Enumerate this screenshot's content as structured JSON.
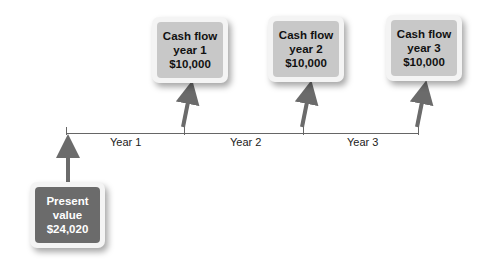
{
  "cash_flows": [
    {
      "line1": "Cash flow",
      "line2": "year 1",
      "amount": "$10,000"
    },
    {
      "line1": "Cash flow",
      "line2": "year 2",
      "amount": "$10,000"
    },
    {
      "line1": "Cash flow",
      "line2": "year 3",
      "amount": "$10,000"
    }
  ],
  "present_value": {
    "line1": "Present",
    "line2": "value",
    "amount": "$24,020"
  },
  "timeline": {
    "labels": [
      "Year 1",
      "Year 2",
      "Year 3"
    ]
  },
  "colors": {
    "arrow": "#6b6b6b",
    "cash_flow_box": "#c8c8c8",
    "present_value_box": "#6b6b6b"
  }
}
